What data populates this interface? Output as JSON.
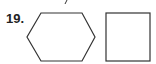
{
  "problem": {
    "number": "19.",
    "shapes": [
      {
        "type": "hexagon",
        "points": "41,13 82,13 95,37 82,61 41,61 27,37"
      },
      {
        "type": "square",
        "x": 106,
        "y": 13,
        "width": 44,
        "height": 48
      }
    ]
  }
}
